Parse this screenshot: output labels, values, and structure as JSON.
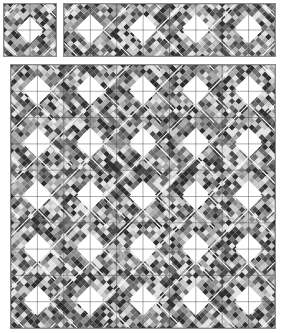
{
  "canvas": {
    "width": 281,
    "height": 333,
    "background": "#ffffff"
  },
  "palette": {
    "grays": [
      "#e2e2e2",
      "#c8c8c8",
      "#a9a9a9",
      "#8c8c8c",
      "#6c6c6c",
      "#4a4a4a",
      "#2e2e2e"
    ],
    "sash": "#ffffff",
    "center": "#ffffff",
    "grid_line": "#3a3a3a",
    "border": "#8a8a8a"
  },
  "block": {
    "style": "square-in-square diamond ring with checkerboard bands",
    "inner_diamond_radius": 0.25,
    "outer_sash_radius": 0.75,
    "checker_divisions": 8,
    "sash_width": 1.1,
    "grid_width": 0.6
  },
  "panels": [
    {
      "id": "single-block-preview",
      "x": 3,
      "y": 3,
      "width": 54,
      "height": 54,
      "cols": 1,
      "rows": 1,
      "seed": 7
    },
    {
      "id": "four-block-row-preview",
      "x": 63,
      "y": 3,
      "width": 213,
      "height": 54,
      "cols": 4,
      "rows": 1,
      "seed": 19
    },
    {
      "id": "full-quilt-layout",
      "x": 10,
      "y": 64,
      "width": 266,
      "height": 265,
      "cols": 5,
      "rows": 5,
      "seed": 42
    }
  ]
}
